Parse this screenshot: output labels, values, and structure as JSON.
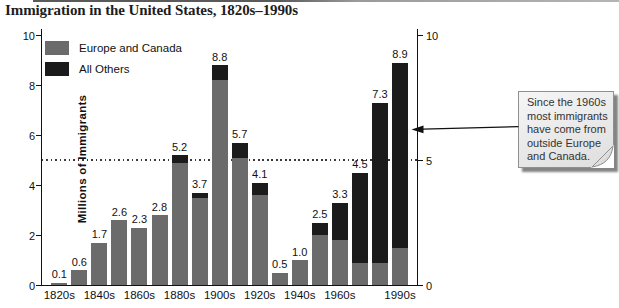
{
  "page_title": "Immigration in the United States, 1820s–1990s",
  "chart_data": {
    "type": "bar",
    "stacked": true,
    "title": "Immigration in the United States, 1820s–1990s",
    "xlabel": "",
    "ylabel": "Millions of Immigrants",
    "ylim": [
      0,
      10
    ],
    "left_axis_ticks": [
      0,
      2,
      4,
      6,
      8,
      10
    ],
    "right_axis_ticks": [
      0,
      5,
      10
    ],
    "reference_line_value": 5,
    "grid": "single dotted horizontal line at 5",
    "legend_position": "top-left inside plot",
    "categories": [
      "1820s",
      "1830s",
      "1840s",
      "1850s",
      "1860s",
      "1870s",
      "1880s",
      "1890s",
      "1900s",
      "1910s",
      "1920s",
      "1930s",
      "1940s",
      "1950s",
      "1960s",
      "1970s",
      "1980s",
      "1990s"
    ],
    "x_tick_labels": [
      "1820s",
      "",
      "1840s",
      "",
      "1860s",
      "",
      "1880s",
      "",
      "1900s",
      "",
      "1920s",
      "",
      "1940s",
      "",
      "1960s",
      "",
      "",
      "1990s"
    ],
    "legend": [
      {
        "label": "Europe and Canada",
        "color": "#6b6b6b"
      },
      {
        "label": "All Others",
        "color": "#1b1b1b"
      }
    ],
    "series": [
      {
        "name": "Europe and Canada",
        "color": "#6b6b6b",
        "values": [
          0.1,
          0.6,
          1.7,
          2.6,
          2.3,
          2.8,
          4.9,
          3.5,
          8.2,
          5.1,
          3.6,
          0.5,
          1.0,
          2.0,
          1.8,
          0.9,
          0.9,
          1.5
        ]
      },
      {
        "name": "All Others",
        "color": "#1b1b1b",
        "values": [
          0,
          0,
          0,
          0,
          0,
          0,
          0.3,
          0.2,
          0.6,
          0.6,
          0.5,
          0,
          0,
          0.5,
          1.5,
          3.6,
          6.4,
          7.4
        ]
      }
    ],
    "totals": [
      0.1,
      0.6,
      1.7,
      2.6,
      2.3,
      2.8,
      5.2,
      3.7,
      8.8,
      5.7,
      4.1,
      0.5,
      1.0,
      2.5,
      3.3,
      4.5,
      7.3,
      8.9
    ],
    "bar_labels": [
      "0.1",
      "0.6",
      "1.7",
      "2.6",
      "2.3",
      "2.8",
      "5.2",
      "3.7",
      "8.8",
      "5.7",
      "4.1",
      "0.5",
      "1.0",
      "2.5",
      "3.3",
      "4.5",
      "7.3",
      "8.9"
    ]
  },
  "annotation": {
    "text": "Since the 1960s most immigrants have come from outside Europe and Canada.",
    "points_to": "right axis near value 6"
  },
  "colors": {
    "europe_and_canada": "#6b6b6b",
    "all_others": "#1b1b1b",
    "axis": "#111111",
    "note_fill": "#ededed",
    "note_border": "#8f8f8f"
  }
}
